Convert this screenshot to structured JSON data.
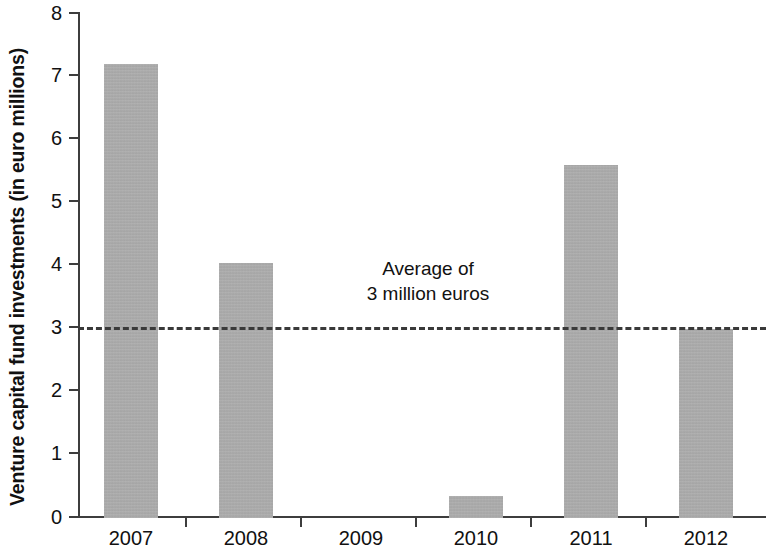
{
  "chart_data": {
    "type": "bar",
    "title": "",
    "subtitle": "",
    "xlabel": "",
    "ylabel": "Venture capital fund investments (in euro millions)",
    "categories": [
      "2007",
      "2008",
      "2009",
      "2010",
      "2011",
      "2012"
    ],
    "values": [
      7.2,
      4.05,
      0,
      0.35,
      5.6,
      3.0
    ],
    "series": [
      {
        "name": "Venture capital fund investments",
        "values": [
          7.2,
          4.05,
          0,
          0.35,
          5.6,
          3.0
        ]
      }
    ],
    "ylim": [
      0,
      8
    ],
    "yticks": [
      0,
      1,
      2,
      3,
      4,
      5,
      6,
      7,
      8
    ],
    "ytick_labels": [
      "0",
      "1",
      "2",
      "3",
      "4",
      "5",
      "6",
      "7",
      "8"
    ],
    "grid": false,
    "legend": "none",
    "bar_color": "#ababab",
    "axis_color": "#3d3d3d",
    "text_color": "#111111",
    "annotations": [
      {
        "name": "average-reference-line",
        "type": "hline",
        "value": 3,
        "style": "dashed",
        "color": "#3a3a3a",
        "label_line_1": "Average of",
        "label_line_2": "3 million euros"
      }
    ]
  }
}
